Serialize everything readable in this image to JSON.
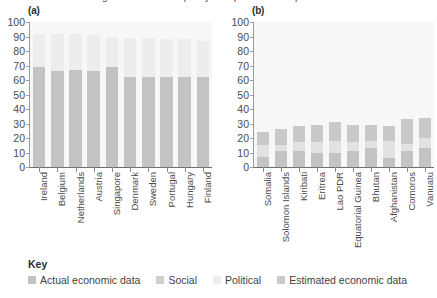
{
  "figure": {
    "title": "Figure: Statistical capacity — top and bottom performers"
  },
  "legend": {
    "title": "Key",
    "items": [
      {
        "label": "Actual economic data",
        "color": "#c3c3c3"
      },
      {
        "label": "Social",
        "color": "#cfcfcf"
      },
      {
        "label": "Political",
        "color": "#ededed"
      },
      {
        "label": "Estimated economic data",
        "color": "#c9c9c9"
      }
    ]
  },
  "chart_data": [
    {
      "type": "bar",
      "panel": "a",
      "panel_label": "(a)",
      "title": "",
      "xlabel": "",
      "ylabel": "",
      "ylim": [
        0,
        100
      ],
      "yticks": [
        0,
        10,
        20,
        30,
        40,
        50,
        60,
        70,
        80,
        90,
        100
      ],
      "grid": false,
      "stacked": true,
      "legend_position": "bottom",
      "categories": [
        "Ireland",
        "Belgium",
        "Netherlands",
        "Austria",
        "Singapore",
        "Denmark",
        "Sweden",
        "Portugal",
        "Hungary",
        "Finland"
      ],
      "series": [
        {
          "name": "Actual economic data",
          "color": "#c3c3c3",
          "values": [
            69,
            66,
            67,
            66,
            69,
            62,
            62,
            62,
            62,
            62
          ]
        },
        {
          "name": "Political",
          "color": "#ededed",
          "values": [
            23,
            26,
            25,
            25,
            21,
            27,
            27,
            26,
            26,
            25
          ]
        }
      ],
      "totals": [
        92,
        92,
        92,
        91,
        90,
        89,
        89,
        88,
        88,
        87
      ]
    },
    {
      "type": "bar",
      "panel": "b",
      "panel_label": "(b)",
      "title": "",
      "xlabel": "",
      "ylabel": "",
      "ylim": [
        0,
        100
      ],
      "yticks": [
        0,
        10,
        20,
        30,
        40,
        50,
        60,
        70,
        80,
        90,
        100
      ],
      "grid": false,
      "stacked": true,
      "legend_position": "bottom",
      "categories": [
        "Somalia",
        "Solomon Islands",
        "Kiribati",
        "Eritrea",
        "Lao PDR",
        "Equatorial Guinea",
        "Bhutan",
        "Afghanistan",
        "Comoros",
        "Vanuatu"
      ],
      "series": [
        {
          "name": "Actual economic data",
          "color": "#c3c3c3",
          "values": [
            7,
            11,
            11,
            10,
            10,
            11,
            13,
            6,
            11,
            13
          ]
        },
        {
          "name": "Social",
          "color": "#e2e2e2",
          "values": [
            8,
            4,
            6,
            7,
            8,
            6,
            5,
            12,
            5,
            7
          ]
        },
        {
          "name": "Estimated economic data",
          "color": "#c9c9c9",
          "values": [
            9,
            11,
            11,
            12,
            13,
            12,
            11,
            10,
            17,
            14
          ]
        }
      ],
      "totals": [
        24,
        26,
        28,
        29,
        31,
        29,
        29,
        28,
        33,
        34
      ]
    }
  ]
}
